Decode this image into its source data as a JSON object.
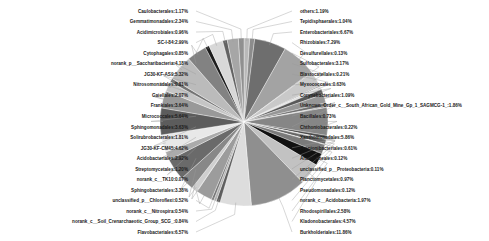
{
  "chart_data": {
    "type": "pie",
    "title": "",
    "subtitle": "",
    "xlabel": "",
    "ylabel": "",
    "legend_position": "none",
    "grid": false,
    "value_unit": "%",
    "label_format": "name:value%",
    "categories": [
      "others",
      "Tepidisphaerales",
      "Enterobacteriales",
      "Rhizobiales",
      "Desulfurellales",
      "Sulfobacterales",
      "Blastocatellales",
      "Myxococcales",
      "Corynebacteriales",
      "Unknown_Order_c__South_African_Gold_Mine_Gp_1_SAGMCG-1",
      "Bacillales",
      "Chthoniobacterales",
      "Xanthomonadales",
      "Propionibacteriales",
      "Anaerolineales",
      "unclassified_p__Proteobacteria",
      "Planctomycetales",
      "Pseudomonadales",
      "norank_c__Acidobacteria",
      "Rhodospirillales",
      "Kladonobacterales",
      "Burkholderiales",
      "Flavobacteriales",
      "norank_c__Soil_Crenarchaeotic_Group_SCG",
      "norank_c__Nitrospira",
      "unclassified_p__Chloroflexi",
      "Sphingobacteriales",
      "norank_c__TK10",
      "Streptomycetales",
      "Acidobacteriales",
      "JG30-KF-CM45",
      "Solirubrobacterales",
      "Sphingomonadales",
      "Micrococcales",
      "Frankiales",
      "Gaiellales",
      "Nitrosomonadales",
      "JG30-KF-AS9",
      "norank_p__Saccharibacteria",
      "Cytophagales",
      "SC-I-84",
      "Acidimicrobiales",
      "Gemmatimonadales",
      "Caulobacterales"
    ],
    "values": [
      1.19,
      1.04,
      6.67,
      7.29,
      0.13,
      3.17,
      0.21,
      0.63,
      1.09,
      1.86,
      0.73,
      0.22,
      5.86,
      0.61,
      0.12,
      0.11,
      0.97,
      0.12,
      1.97,
      2.58,
      4.57,
      11.86,
      6.57,
      0.84,
      0.54,
      0.52,
      3.38,
      0.07,
      1.2,
      2.92,
      4.62,
      1.81,
      3.63,
      5.64,
      3.64,
      2.07,
      0.81,
      5.32,
      4.18,
      0.85,
      2.99,
      0.96,
      2.34,
      1.17
    ],
    "labels": [
      "others:1.19%",
      "Tepidisphaerales:1.04%",
      "Enterobacteriales:6.67%",
      "Rhizobiales:7.29%",
      "Desulfurellales:0.13%",
      "Sulfobacterales:3.17%",
      "Blastocatellales:0.21%",
      "Myxococcales:0.63%",
      "Corynebacteriales:1.09%",
      "Unknown_Order_c__South_African_Gold_Mine_Gp_1_SAGMCG-1_:1.86%",
      "Bacillales:0.73%",
      "Chthoniobacterales:0.22%",
      "Xanthomonadales:5.86%",
      "Propionibacteriales:0.61%",
      "Anaerolineales:0.12%",
      "unclassified_p__Proteobacteria:0.11%",
      "Planctomycetales:0.97%",
      "Pseudomonadales:0.12%",
      "norank_c__Acidobacteria:1.97%",
      "Rhodospirillales:2.58%",
      "Kladonobacterales:4.57%",
      "Burkholderiales:11.86%",
      "Flavobacteriales:6.57%",
      "norank_c__Soil_Crenarchaeotic_Group_SCG_:0.84%",
      "norank_c__Nitrospira:0.54%",
      "unclassified_p__Chloroflexi:0.52%",
      "Sphingobacteriales:3.38%",
      "norank_c__TK10:0.07%",
      "Streptomycetales:1.20%",
      "Acidobacteriales:2.92%",
      "JG30-KF-CM45:4.62%",
      "Solirubrobacterales:1.81%",
      "Sphingomonadales:3.63%",
      "Micrococcales:5.64%",
      "Frankiales:3.64%",
      "Gaiellales:2.07%",
      "Nitrosomonadales:0.81%",
      "JG30-KF-AS9:5.32%",
      "norank_p__Saccharibacteria:4.18%",
      "Cytophagales:0.85%",
      "SC-I-84:2.99%",
      "Acidimicrobiales:0.96%",
      "Gemmatimonadales:2.34%",
      "Caulobacterales:1.17%"
    ],
    "colors": [
      "#b9b9b9",
      "#8c8c8c",
      "#6e6e6e",
      "#a3a3a3",
      "#515151",
      "#c9c9c9",
      "#7f7f7f",
      "#e2e2e2",
      "#595959",
      "#969696",
      "#707070",
      "#bdbdbd",
      "#868686",
      "#4a4a4a",
      "#d4d4d4",
      "#a8a8a8",
      "#656565",
      "#efefef",
      "#7a7a7a",
      "#111111",
      "#c2c2c2",
      "#8f8f8f",
      "#dddddd",
      "#5e5e5e",
      "#b0b0b0",
      "#767676",
      "#9c9c9c",
      "#454545",
      "#cfcfcf",
      "#888888",
      "#6a6a6a",
      "#ababab",
      "#e8e8e8",
      "#5c5c5c",
      "#999999",
      "#c5c5c5",
      "#737373",
      "#bbbbbb",
      "#828282",
      "#1d1d1d",
      "#d8d8d8",
      "#636363",
      "#a6a6a6",
      "#909090"
    ]
  },
  "figure": {
    "background": "#ffffff",
    "label_color": "#1a1a1a",
    "leader_color": "#9a9a9a",
    "slice_border": "#ffffff"
  }
}
